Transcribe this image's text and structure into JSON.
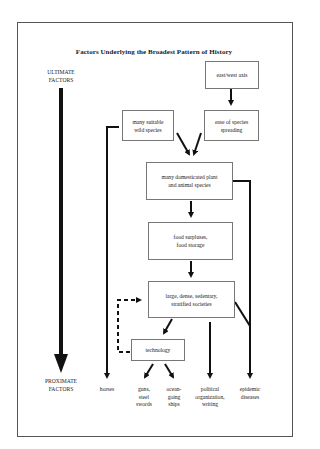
{
  "title": "Factors Underlying the Broadest Pattern of History",
  "axis": {
    "top_label_line1": "ULTIMATE",
    "top_label_line2": "FACTORS",
    "bottom_label_line1": "PROXIMATE",
    "bottom_label_line2": "FACTORS"
  },
  "nodes": {
    "east_west_axis": "east/west axis",
    "wild_species": {
      "line1": "many suitable",
      "line2": "wild species"
    },
    "ease_spreading": {
      "line1": "ease of species",
      "line2": "spreading"
    },
    "domesticated": {
      "line1": "many domesticated plant",
      "line2": "and animal species"
    },
    "food": {
      "line1": "food surpluses,",
      "line2": "food storage"
    },
    "societies": {
      "line1": "large, dense, sedentary,",
      "line2": "stratified societies"
    },
    "technology": "technology"
  },
  "outcomes": {
    "horses": "horses",
    "guns": {
      "line1": "guns,",
      "line2": "steel",
      "line3": "swords"
    },
    "ships": {
      "line1": "ocean-",
      "line2": "going",
      "line3": "ships"
    },
    "political": {
      "line1": "political",
      "line2": "organization,",
      "line3": "writing"
    },
    "epidemic": {
      "line1": "epidemic",
      "line2": "diseases"
    }
  },
  "edges": [
    {
      "from": "east_west_axis",
      "to": "ease_spreading",
      "style": "solid"
    },
    {
      "from": "wild_species",
      "to": "domesticated",
      "style": "solid"
    },
    {
      "from": "ease_spreading",
      "to": "domesticated",
      "style": "solid"
    },
    {
      "from": "domesticated",
      "to": "food",
      "style": "solid"
    },
    {
      "from": "food",
      "to": "societies",
      "style": "solid"
    },
    {
      "from": "societies",
      "to": "technology",
      "style": "solid"
    },
    {
      "from": "technology",
      "to": "societies",
      "style": "dashed"
    },
    {
      "from": "technology",
      "to": "guns",
      "style": "solid"
    },
    {
      "from": "technology",
      "to": "ships",
      "style": "solid"
    },
    {
      "from": "societies",
      "to": "political",
      "style": "solid"
    },
    {
      "from": "wild_species",
      "to": "horses",
      "style": "solid"
    },
    {
      "from": "domesticated",
      "to": "epidemic",
      "style": "solid"
    },
    {
      "from": "societies",
      "to": "epidemic",
      "style": "solid"
    }
  ]
}
